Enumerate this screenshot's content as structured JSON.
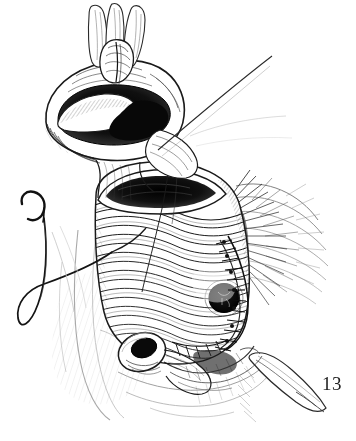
{
  "figure": {
    "number_label": "13",
    "caption": "",
    "domain": "medical-surgical-illustration",
    "medium": "pen-and-ink line drawing",
    "background_color": "#ffffff",
    "ink_color": "#1a1a1a",
    "mid_tone_color": "#6b6b6b",
    "light_tone_color": "#b9b9b9",
    "canvas": {
      "width": 356,
      "height": 441
    }
  },
  "elements": {
    "retracted_bowel_top": {
      "name": "Retracted proximal bowel segment held open",
      "center": [
        118,
        108
      ],
      "dark_lumen": true
    },
    "grasping_fingers": {
      "name": "Gloved fingers / forceps grasping bowel edge",
      "center": [
        124,
        36
      ],
      "count": 3
    },
    "suture_thread_upper": {
      "name": "Suture thread running to upper right",
      "from": [
        176,
        148
      ],
      "to": [
        272,
        56
      ]
    },
    "anastomosis_suture_knots": {
      "name": "Interrupted suture knots at anastomosis",
      "center": [
        172,
        150
      ]
    },
    "main_bowel_body": {
      "name": "Opened gastric / bowel pouch with rugal folds",
      "center": [
        170,
        250
      ]
    },
    "dark_stoma": {
      "name": "Dark round stoma opening on anterior wall",
      "center": [
        224,
        298
      ],
      "radius": 14
    },
    "lateral_suture_line": {
      "name": "Running suture line along right lateral border",
      "from": [
        232,
        250
      ],
      "to": [
        266,
        330
      ]
    },
    "mesentery_hatching": {
      "name": "Fanned mesenteric hatching at right",
      "center": [
        280,
        225
      ]
    },
    "curved_needle": {
      "name": "Curved surgical needle with trailing thread loop",
      "center": [
        42,
        250
      ]
    },
    "thread_loop": {
      "name": "Looping suture thread",
      "center": [
        44,
        280
      ]
    },
    "lower_stoma": {
      "name": "Small tubular stoma / divided duct at lower left",
      "center": [
        142,
        352
      ],
      "radius": 16
    },
    "surgical_instrument": {
      "name": "Surgical retractor blade entering from lower right",
      "from": [
        258,
        360
      ],
      "to": [
        318,
        412
      ]
    },
    "abdominal_wall": {
      "name": "Surrounding abdominal wall and retracted tissue",
      "center": [
        180,
        340
      ]
    }
  },
  "palette": {
    "ink": "#1a1a1a",
    "dark_fill": "#111111",
    "mid_gray": "#6b6b6b",
    "light_gray": "#b0b0b0",
    "paper": "#ffffff"
  }
}
